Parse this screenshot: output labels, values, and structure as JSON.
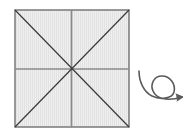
{
  "diagram": {
    "type": "folding-diagram",
    "square": {
      "x": 15,
      "y": 10,
      "width": 114,
      "height": 117,
      "fill": "#ececec",
      "stroke": "#6a6a6a",
      "crease_lines": [
        "vertical-center",
        "horizontal-center",
        "diagonal-tl-br",
        "diagonal-tr-bl"
      ]
    },
    "symbols": [
      {
        "name": "turn-over-arrow",
        "meaning": "turn over",
        "color": "#5a5a5a"
      }
    ]
  }
}
